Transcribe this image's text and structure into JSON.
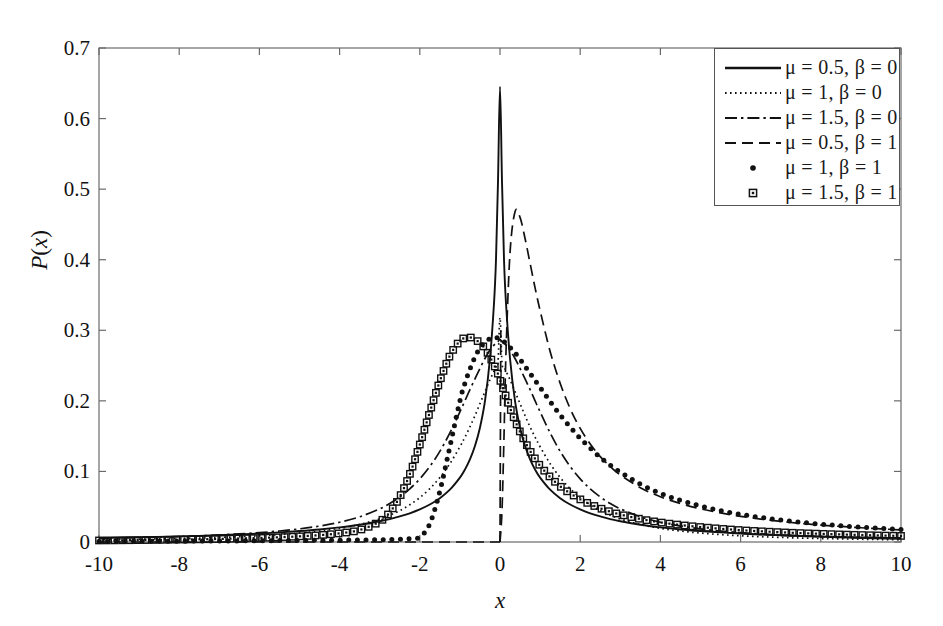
{
  "figure": {
    "width": 943,
    "height": 626,
    "background": "#ffffff",
    "foreground": "#111111"
  },
  "axis": {
    "x_label": "x",
    "y_label": "P(x)",
    "x_ticks": [
      "-10",
      "-8",
      "-6",
      "-4",
      "-2",
      "0",
      "2",
      "4",
      "6",
      "8",
      "10"
    ],
    "y_ticks": [
      "0",
      "0.1",
      "0.2",
      "0.3",
      "0.4",
      "0.5",
      "0.6",
      "0.7"
    ]
  },
  "legend": {
    "position": "top-right",
    "entries": [
      {
        "label": "μ = 0.5, β = 0",
        "style": "solid",
        "marker": "none"
      },
      {
        "label": "μ = 1, β = 0",
        "style": "dotted",
        "marker": "none"
      },
      {
        "label": "μ = 1.5, β = 0",
        "style": "dashdot",
        "marker": "none"
      },
      {
        "label": "μ = 0.5, β = 1",
        "style": "dashed",
        "marker": "none"
      },
      {
        "label": "μ = 1, β = 1",
        "style": "none",
        "marker": "dot"
      },
      {
        "label": "μ = 1.5, β = 1",
        "style": "none",
        "marker": "square"
      }
    ]
  },
  "chart_data": {
    "type": "line",
    "title": "",
    "subtitle": "",
    "xlabel": "x",
    "ylabel": "P(x)",
    "xlim": [
      -10,
      10
    ],
    "ylim": [
      0,
      0.7
    ],
    "xticks": [
      -10,
      -8,
      -6,
      -4,
      -2,
      0,
      2,
      4,
      6,
      8,
      10
    ],
    "yticks": [
      0,
      0.1,
      0.2,
      0.3,
      0.4,
      0.5,
      0.6,
      0.7
    ],
    "grid": false,
    "legend_position": "upper right",
    "x": [
      -10,
      -9.5,
      -9,
      -8.5,
      -8,
      -7.5,
      -7,
      -6.5,
      -6,
      -5.5,
      -5,
      -4.5,
      -4,
      -3.5,
      -3,
      -2.75,
      -2.5,
      -2.25,
      -2,
      -1.75,
      -1.5,
      -1.25,
      -1,
      -0.875,
      -0.75,
      -0.625,
      -0.5,
      -0.375,
      -0.25,
      -0.15,
      -0.1,
      -0.05,
      0,
      0.05,
      0.1,
      0.15,
      0.25,
      0.375,
      0.5,
      0.625,
      0.75,
      0.875,
      1,
      1.25,
      1.5,
      1.75,
      2,
      2.25,
      2.5,
      2.75,
      3,
      3.5,
      4,
      4.5,
      5,
      5.5,
      6,
      6.5,
      7,
      7.5,
      8,
      8.5,
      9,
      9.5,
      10
    ],
    "series": [
      {
        "name": "μ = 0.5, β = 0",
        "style": "solid",
        "marker": "none",
        "color": "#111111",
        "values": [
          0.0056,
          0.0061,
          0.0066,
          0.0072,
          0.0079,
          0.0087,
          0.0096,
          0.0107,
          0.012,
          0.0136,
          0.0155,
          0.0178,
          0.0208,
          0.0245,
          0.0294,
          0.0325,
          0.0362,
          0.0407,
          0.0462,
          0.0531,
          0.0621,
          0.0742,
          0.0913,
          0.1026,
          0.117,
          0.136,
          0.162,
          0.1995,
          0.26,
          0.338,
          0.4,
          0.51,
          0.645,
          0.51,
          0.4,
          0.338,
          0.26,
          0.1995,
          0.162,
          0.136,
          0.117,
          0.1026,
          0.0913,
          0.0742,
          0.0621,
          0.0531,
          0.0462,
          0.0407,
          0.0362,
          0.0325,
          0.0294,
          0.0245,
          0.0208,
          0.0178,
          0.0155,
          0.0136,
          0.012,
          0.0107,
          0.0096,
          0.0087,
          0.0079,
          0.0072,
          0.0066,
          0.0061,
          0.0056
        ]
      },
      {
        "name": "μ = 1, β = 0",
        "style": "dotted",
        "marker": "none",
        "color": "#111111",
        "values": [
          0.0031,
          0.0035,
          0.0039,
          0.0044,
          0.0049,
          0.0056,
          0.0065,
          0.0075,
          0.0088,
          0.0105,
          0.0127,
          0.0155,
          0.0194,
          0.0249,
          0.0326,
          0.0379,
          0.0445,
          0.0527,
          0.0629,
          0.0756,
          0.0914,
          0.111,
          0.135,
          0.1485,
          0.163,
          0.179,
          0.196,
          0.213,
          0.23,
          0.242,
          0.248,
          0.254,
          0.318,
          0.254,
          0.248,
          0.242,
          0.23,
          0.213,
          0.196,
          0.179,
          0.163,
          0.1485,
          0.135,
          0.111,
          0.0914,
          0.0756,
          0.0629,
          0.0527,
          0.0445,
          0.0379,
          0.0326,
          0.0249,
          0.0194,
          0.0155,
          0.0127,
          0.0105,
          0.0088,
          0.0075,
          0.0065,
          0.0056,
          0.0049,
          0.0044,
          0.0039,
          0.0035,
          0.0031
        ]
      },
      {
        "name": "μ = 1.5, β = 0",
        "style": "dashdot",
        "marker": "none",
        "color": "#111111",
        "values": [
          0.0052,
          0.0057,
          0.0063,
          0.007,
          0.0078,
          0.0088,
          0.01,
          0.0115,
          0.0133,
          0.0156,
          0.0186,
          0.0226,
          0.028,
          0.0357,
          0.047,
          0.0545,
          0.0638,
          0.0752,
          0.0895,
          0.107,
          0.1285,
          0.1545,
          0.1845,
          0.2,
          0.216,
          0.231,
          0.246,
          0.26,
          0.272,
          0.279,
          0.282,
          0.284,
          0.287,
          0.284,
          0.282,
          0.279,
          0.272,
          0.26,
          0.246,
          0.231,
          0.216,
          0.2,
          0.1845,
          0.1545,
          0.1285,
          0.107,
          0.0895,
          0.0752,
          0.0638,
          0.0545,
          0.047,
          0.0357,
          0.028,
          0.0226,
          0.0186,
          0.0156,
          0.0133,
          0.0115,
          0.01,
          0.0088,
          0.0078,
          0.007,
          0.0063,
          0.0057,
          0.0052
        ]
      },
      {
        "name": "μ = 0.5, β = 1",
        "style": "dashed",
        "marker": "none",
        "color": "#111111",
        "values": [
          0,
          0,
          0,
          0,
          0,
          0,
          0,
          0,
          0,
          0,
          0,
          0,
          0,
          0,
          0,
          0,
          0,
          0,
          0,
          0,
          0,
          0,
          0,
          0,
          0,
          0,
          0,
          0,
          0,
          0,
          0,
          0,
          0,
          0.045,
          0.15,
          0.27,
          0.41,
          0.468,
          0.46,
          0.43,
          0.395,
          0.36,
          0.328,
          0.27,
          0.225,
          0.189,
          0.161,
          0.139,
          0.121,
          0.107,
          0.095,
          0.077,
          0.064,
          0.0545,
          0.047,
          0.0412,
          0.0364,
          0.0325,
          0.0292,
          0.0264,
          0.024,
          0.022,
          0.0202,
          0.0186,
          0.0172
        ]
      },
      {
        "name": "μ = 1, β = 1",
        "style": "none",
        "marker": "dot",
        "color": "#111111",
        "values": [
          0.0008,
          0.0009,
          0.001,
          0.0011,
          0.0012,
          0.0013,
          0.0014,
          0.0016,
          0.0018,
          0.002,
          0.0022,
          0.0024,
          0.0026,
          0.0028,
          0.0031,
          0.0034,
          0.0038,
          0.0046,
          0.007,
          0.026,
          0.072,
          0.135,
          0.2,
          0.225,
          0.245,
          0.262,
          0.275,
          0.283,
          0.288,
          0.29,
          0.29,
          0.289,
          0.288,
          0.286,
          0.284,
          0.282,
          0.276,
          0.268,
          0.259,
          0.249,
          0.239,
          0.229,
          0.219,
          0.199,
          0.18,
          0.163,
          0.147,
          0.133,
          0.12,
          0.109,
          0.099,
          0.082,
          0.069,
          0.059,
          0.051,
          0.0445,
          0.0392,
          0.0348,
          0.0311,
          0.028,
          0.0253,
          0.023,
          0.021,
          0.0193,
          0.0178
        ]
      },
      {
        "name": "μ = 1.5, β = 1",
        "style": "none",
        "marker": "square",
        "color": "#111111",
        "values": [
          0.0022,
          0.0024,
          0.0027,
          0.003,
          0.0034,
          0.0038,
          0.0043,
          0.005,
          0.0057,
          0.0067,
          0.008,
          0.0097,
          0.0123,
          0.017,
          0.029,
          0.042,
          0.064,
          0.096,
          0.138,
          0.184,
          0.228,
          0.264,
          0.285,
          0.289,
          0.29,
          0.287,
          0.282,
          0.274,
          0.262,
          0.251,
          0.245,
          0.238,
          0.23,
          0.222,
          0.214,
          0.206,
          0.19,
          0.172,
          0.156,
          0.142,
          0.129,
          0.118,
          0.108,
          0.092,
          0.079,
          0.069,
          0.0605,
          0.0535,
          0.0478,
          0.043,
          0.039,
          0.0326,
          0.0278,
          0.0241,
          0.0212,
          0.0188,
          0.0168,
          0.0152,
          0.0138,
          0.0126,
          0.0116,
          0.0107,
          0.0099,
          0.0092,
          0.0086
        ]
      }
    ]
  }
}
